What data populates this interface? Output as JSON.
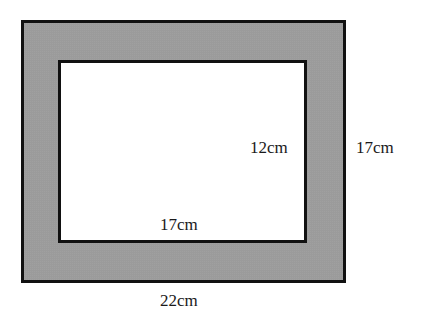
{
  "diagram": {
    "type": "frame-area",
    "colors": {
      "frame_fill": "#a9a9a9",
      "border": "#111111",
      "inner_fill": "#ffffff",
      "text": "#1a1a1a"
    },
    "labels": {
      "inner_width": "17cm",
      "inner_height": "12cm",
      "outer_width": "22cm",
      "outer_height": "17cm"
    }
  }
}
